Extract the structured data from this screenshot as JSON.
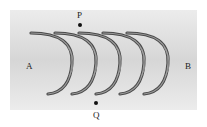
{
  "labels": {
    "A": "A",
    "B": "B",
    "P": "P",
    "Q": "Q"
  },
  "arcs": {
    "count": 5,
    "description": "Five concentric-like curved gray arcs (wave fronts) propagating from A toward B"
  },
  "colors": {
    "background_panel": "#e4e4e4",
    "arc_dark": "#4a4a4a",
    "arc_light": "#9a9a9a",
    "dot": "#111111"
  }
}
